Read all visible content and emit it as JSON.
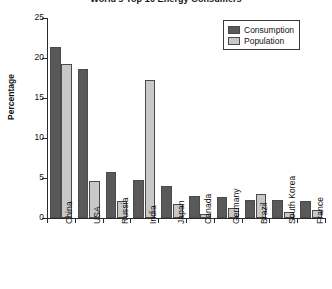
{
  "chart_data": {
    "type": "bar",
    "title": "World's Top 10 Energy Consumers",
    "xlabel": "",
    "ylabel": "Percentage",
    "ylim": [
      0,
      25
    ],
    "yticks": [
      0,
      5,
      10,
      15,
      20,
      25
    ],
    "ytick_labels": [
      "0",
      "5",
      "10",
      "15",
      "20",
      "25"
    ],
    "grid": false,
    "legend_position": "top-right",
    "categories": [
      "China",
      "USA",
      "Russia",
      "India",
      "Japan",
      "Canada",
      "Germany",
      "Brazil",
      "South Korea",
      "France"
    ],
    "series": [
      {
        "name": "Consumption",
        "color": "#595959",
        "values": [
          21.4,
          18.6,
          5.7,
          4.7,
          4.0,
          2.8,
          2.6,
          2.3,
          2.2,
          2.1
        ]
      },
      {
        "name": "Population",
        "color": "#c8c8c8",
        "values": [
          19.2,
          4.6,
          2.1,
          17.3,
          1.8,
          0.5,
          1.3,
          3.0,
          0.8,
          1.0
        ]
      }
    ]
  },
  "legend": {
    "items": [
      {
        "label": "Consumption"
      },
      {
        "label": "Population"
      }
    ]
  }
}
